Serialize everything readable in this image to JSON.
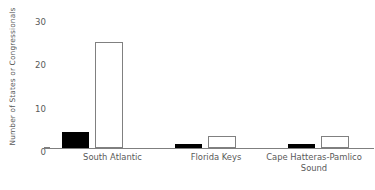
{
  "chart_data": {
    "type": "bar",
    "title": "",
    "xlabel": "",
    "ylabel": "Number of States or Congressionals",
    "categories": [
      "South Atlantic",
      "Florida Keys",
      "Cape Hatteras-Pamlico Sound"
    ],
    "series": [
      {
        "name": "black",
        "values": [
          4,
          1,
          1
        ]
      },
      {
        "name": "white",
        "values": [
          26,
          3,
          3
        ]
      }
    ],
    "ylim": [
      0,
      32
    ],
    "yticks": [
      0,
      10,
      20,
      30
    ],
    "ytick_labels": [
      "0",
      "10",
      "20",
      "30"
    ],
    "grid": false,
    "legend": "none"
  },
  "colors": {
    "filled_bar": "#000000",
    "open_bar_fill": "#ffffff",
    "open_bar_edge": "#808080",
    "text": "#595959",
    "axis": "#7f7f7f",
    "background": "#ffffff"
  }
}
